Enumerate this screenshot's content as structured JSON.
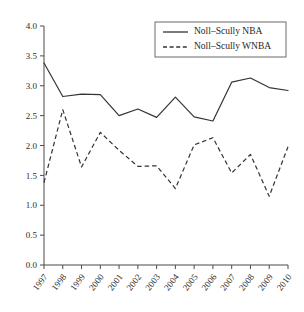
{
  "chart_data": {
    "type": "line",
    "title": "",
    "xlabel": "",
    "ylabel": "",
    "categories": [
      "1997",
      "1998",
      "1999",
      "2000",
      "2001",
      "2002",
      "2003",
      "2004",
      "2005",
      "2006",
      "2007",
      "2008",
      "2009",
      "2010"
    ],
    "series": [
      {
        "name": "Noll-Scully NBA",
        "style": "solid",
        "values": [
          3.38,
          2.82,
          2.86,
          2.85,
          2.5,
          2.61,
          2.47,
          2.81,
          2.48,
          2.41,
          3.06,
          3.13,
          2.97,
          2.92
        ]
      },
      {
        "name": "Noll-Scully WNBA",
        "style": "dashed",
        "values": [
          1.38,
          2.6,
          1.64,
          2.22,
          1.92,
          1.65,
          1.66,
          1.28,
          2.01,
          2.13,
          1.54,
          1.85,
          1.15,
          1.98
        ]
      }
    ],
    "ylim": [
      0.0,
      4.0
    ],
    "yticks": [
      "0.0",
      "0.5",
      "1.0",
      "1.5",
      "2.0",
      "2.5",
      "3.0",
      "3.5",
      "4.0"
    ],
    "ytick_values": [
      0.0,
      0.5,
      1.0,
      1.5,
      2.0,
      2.5,
      3.0,
      3.5,
      4.0
    ],
    "grid": false,
    "legend_position": "top-right",
    "line_color": "#333333",
    "axis_color": "#4a4a4a",
    "background": "#ffffff"
  },
  "legend": {
    "entries": [
      {
        "label": "Noll–Scully NBA",
        "style": "solid"
      },
      {
        "label": "Noll–Scully WNBA",
        "style": "dashed"
      }
    ]
  }
}
